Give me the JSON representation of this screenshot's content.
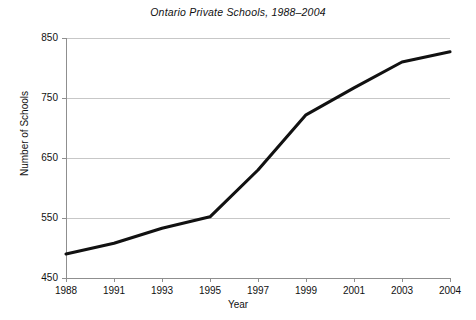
{
  "chart_data": {
    "type": "line",
    "title": "Ontario Private Schools, 1988–2004",
    "xlabel": "Year",
    "ylabel": "Number of Schools",
    "x": [
      1988,
      1991,
      1993,
      1995,
      1997,
      1999,
      2001,
      2003,
      2004
    ],
    "categories": [
      "1988",
      "1991",
      "1993",
      "1995",
      "1997",
      "1999",
      "2001",
      "2003",
      "2004"
    ],
    "values": [
      490,
      508,
      533,
      552,
      630,
      722,
      767,
      810,
      827
    ],
    "series": [
      {
        "name": "Number of Schools",
        "values": [
          490,
          508,
          533,
          552,
          630,
          722,
          767,
          810,
          827
        ]
      }
    ],
    "ylim": [
      450,
      850
    ],
    "yticks": [
      450,
      550,
      650,
      750,
      850
    ],
    "ytick_labels": [
      "450",
      "550",
      "650",
      "750",
      "850"
    ],
    "xtick_labels": [
      "1988",
      "1991",
      "1993",
      "1995",
      "1997",
      "1999",
      "2001",
      "2003",
      "2004"
    ],
    "grid": "horizontal",
    "legend": "none",
    "line_color": "#111111",
    "grid_color": "#b9b9b9",
    "background_color": "#ffffff"
  }
}
